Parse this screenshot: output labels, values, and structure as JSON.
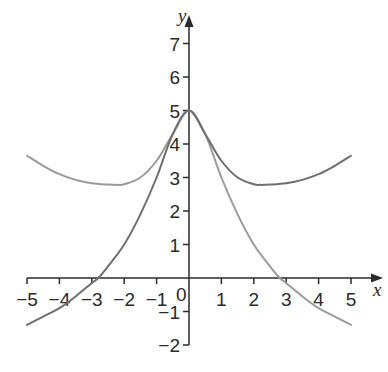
{
  "chart_data": {
    "type": "line",
    "title": "",
    "xlabel": "x",
    "ylabel": "y",
    "xlim": [
      -5,
      5
    ],
    "ylim": [
      -2,
      7
    ],
    "grid": false,
    "legend": null,
    "x_ticks": [
      -5,
      -4,
      -3,
      -2,
      -1,
      1,
      2,
      3,
      4,
      5
    ],
    "x_tick_labels": [
      "−5",
      "−4",
      "−3",
      "−2",
      "−1",
      "1",
      "2",
      "3",
      "4",
      "5"
    ],
    "y_ticks": [
      -2,
      -1,
      1,
      2,
      3,
      4,
      5,
      6,
      7
    ],
    "y_tick_labels": [
      "−2",
      "−1",
      "1",
      "2",
      "3",
      "4",
      "5",
      "6",
      "7"
    ],
    "origin_label": "0",
    "series": [
      {
        "name": "light curve",
        "color": "#9a9a9a",
        "x": [
          -5,
          -4.5,
          -4,
          -3.5,
          -3,
          -2.5,
          -2.2,
          -2,
          -1.5,
          -1,
          -0.5,
          0,
          0.5,
          1,
          1.5,
          2,
          2.5,
          2.8,
          3,
          3.5,
          4,
          4.5,
          5
        ],
        "y": [
          3.65,
          3.35,
          3.1,
          2.93,
          2.83,
          2.79,
          2.78,
          2.8,
          3.0,
          3.5,
          4.3,
          5.0,
          4.3,
          3.0,
          1.9,
          1.0,
          0.35,
          0.0,
          -0.15,
          -0.55,
          -0.9,
          -1.15,
          -1.4
        ]
      },
      {
        "name": "dark curve",
        "color": "#6e6e6e",
        "x": [
          -5,
          -4.5,
          -4,
          -3.5,
          -3,
          -2.8,
          -2.5,
          -2,
          -1.5,
          -1,
          -0.5,
          0,
          0.5,
          1,
          1.5,
          2,
          2.2,
          2.5,
          3,
          3.5,
          4,
          4.5,
          5
        ],
        "y": [
          -1.4,
          -1.15,
          -0.9,
          -0.55,
          -0.15,
          0.0,
          0.35,
          1.0,
          1.9,
          3.0,
          4.3,
          5.0,
          4.3,
          3.5,
          3.0,
          2.8,
          2.78,
          2.79,
          2.83,
          2.93,
          3.1,
          3.35,
          3.65
        ]
      }
    ]
  },
  "layout": {
    "origin_px": [
      189,
      278
    ],
    "unit_x_px": 32.4,
    "unit_y_px": 33.5,
    "axis_color": "#2a2a2a"
  }
}
